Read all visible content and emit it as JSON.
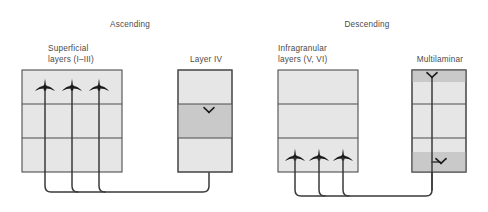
{
  "figure": {
    "panels": [
      {
        "title": "Ascending",
        "title_x": 97,
        "title_y": 19,
        "title_w": 66,
        "source": {
          "label": "Superficial\nlayers (I–III)",
          "label_line1": "Superficial",
          "label_line2": "layers (I–III)",
          "label_x": 48,
          "label_y": 43,
          "box": {
            "x": 22,
            "y": 70,
            "w": 100,
            "h": 102
          },
          "layers": 3,
          "neuron_layer_index": 0,
          "neuron_type": "pyramidal-up",
          "neuron_count": 3,
          "neuron_xs": [
            45,
            72,
            99
          ]
        },
        "target": {
          "label": "Layer IV",
          "label_x": 186,
          "label_y": 54,
          "label_w": 40,
          "box": {
            "x": 178,
            "y": 70,
            "w": 54,
            "h": 102
          },
          "layers": 3,
          "shaded_layer_indices": [
            1
          ],
          "terminals": [
            {
              "layer_index": 1,
              "x": 209,
              "y": 112,
              "orientation": "down"
            }
          ]
        },
        "bus_y": 192,
        "terminal_entry_x": 209
      },
      {
        "title": "Descending",
        "title_x": 330,
        "title_y": 19,
        "title_w": 74,
        "source": {
          "label_line1": "Infragranular",
          "label_line2": "layers (V, VI)",
          "label_x": 278,
          "label_y": 43,
          "box": {
            "x": 278,
            "y": 70,
            "w": 80,
            "h": 102
          },
          "layers": 3,
          "neuron_layer_index": 2,
          "neuron_type": "pyramidal-up",
          "neuron_count": 3,
          "neuron_xs": [
            295,
            319,
            343
          ]
        },
        "target": {
          "label": "Multilaminar",
          "label_x": 412,
          "label_y": 54,
          "label_w": 56,
          "box": {
            "x": 412,
            "y": 70,
            "w": 54,
            "h": 102
          },
          "layers": 3,
          "shaded_bands": [
            {
              "y": 70,
              "h": 12
            },
            {
              "y": 152,
              "h": 20
            }
          ],
          "terminals": [
            {
              "layer_index": 0,
              "x": 432,
              "y": 76,
              "orientation": "down"
            },
            {
              "layer_index": 2,
              "x": 440,
              "y": 162,
              "orientation": "down"
            }
          ]
        },
        "bus_y": 196,
        "terminal_entry_x": 432
      }
    ]
  },
  "colors": {
    "box_fill": "#e6e6e6",
    "box_shaded_fill": "#c9c9c9",
    "box_stroke": "#4d4d4d",
    "wire": "#3a3a3a",
    "neuron": "#1a1a1a",
    "text": "#4a4a4a",
    "background": "#ffffff"
  }
}
